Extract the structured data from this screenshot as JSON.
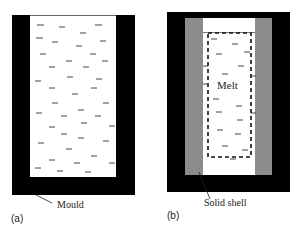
{
  "panel_a": {
    "caption": "(a)",
    "label": "Mould",
    "colors": {
      "mould": "#000000",
      "melt": "#ffffff",
      "dash": "#333333"
    }
  },
  "panel_b": {
    "caption": "(b)",
    "label_shell": "Solid shell",
    "label_melt": "Melt",
    "colors": {
      "mould": "#000000",
      "shell": "#8c8c8c",
      "melt": "#ffffff",
      "boundary": "#111111"
    }
  }
}
